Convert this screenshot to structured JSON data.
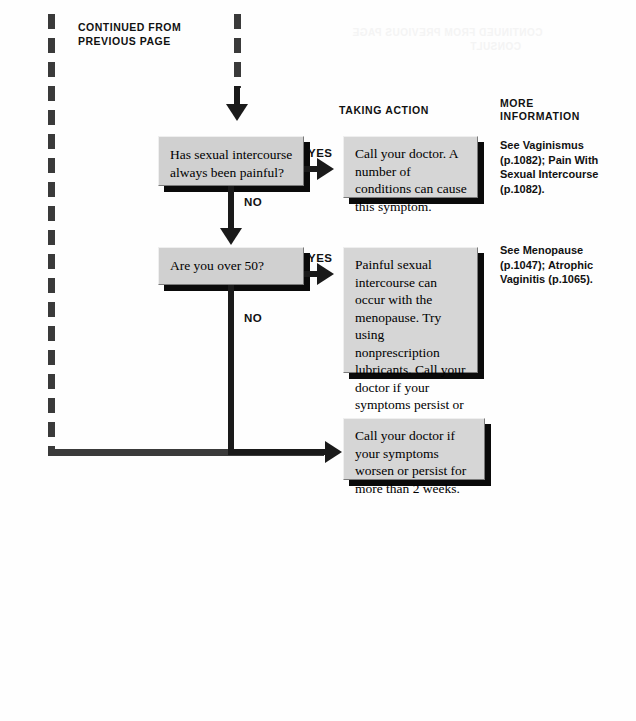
{
  "page": {
    "width": 636,
    "height": 721,
    "background_color": "#fefefe",
    "continued_note": "CONTINUED FROM\nPREVIOUS PAGE"
  },
  "headers": {
    "taking_action": "TAKING ACTION",
    "more_information": "MORE\nINFORMATION"
  },
  "branch_labels": {
    "yes_1": "YES",
    "yes_2": "YES",
    "no_1": "NO",
    "no_2": "NO"
  },
  "decisions": [
    {
      "id": "decision-pain-always",
      "text": "Has sexual intercourse always been painful?"
    },
    {
      "id": "decision-over-50",
      "text": "Are you over 50?"
    }
  ],
  "actions": [
    {
      "id": "action-call-doctor-conditions",
      "text": "Call your doctor. A number of conditions can cause this symptom."
    },
    {
      "id": "action-menopause-lubricants",
      "text": "Painful sexual intercourse can occur with the menopause. Try using nonprescription lubricants. Call your doctor if your symptoms persist or worsen."
    },
    {
      "id": "action-call-doctor-2-weeks",
      "text": "Call your doctor if your symptoms worsen or persist for more than 2 weeks."
    }
  ],
  "more_information": [
    {
      "id": "info-vaginismus",
      "text": "See Vaginismus (p.1082); Pain With Sexual Intercourse (p.1082)."
    },
    {
      "id": "info-menopause",
      "text": "See Menopause (p.1047); Atrophic Vaginitis (p.1065)."
    }
  ],
  "bleed_through": {
    "line1": "CONTINUED FROM PREVIOUS PAGE",
    "line2": "CONSULT"
  },
  "colors": {
    "box_fill": "#d4d4d4",
    "box_border": "#7a7a7a",
    "box_shadow": "#0a0a0a",
    "connector": "#1a1a1a",
    "dashed_connector": "#3a3a3a",
    "text": "#000000"
  }
}
